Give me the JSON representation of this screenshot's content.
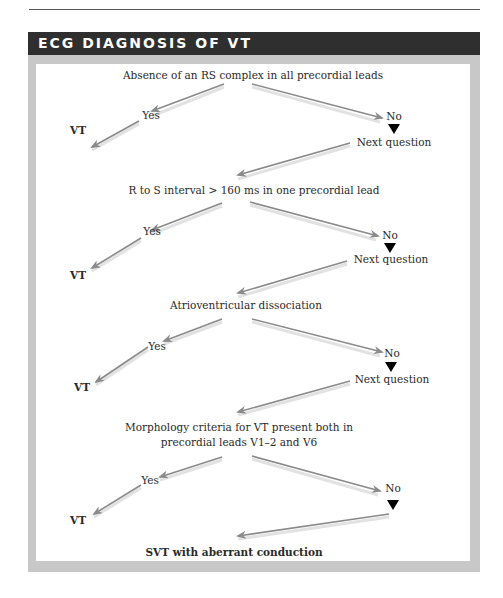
{
  "page": {
    "running_header": "...cardiac diagnosis and physiology"
  },
  "box": {
    "title": "ECG DIAGNOSIS OF VT"
  },
  "flowchart": {
    "questions": [
      {
        "text": "Absence of an RS complex in all precordial leads",
        "yes_label": "Yes",
        "yes_outcome": "VT",
        "no_label": "No",
        "next_label": "Next question"
      },
      {
        "text": "R to S interval > 160 ms in one precordial lead",
        "yes_label": "Yes",
        "yes_outcome": "VT",
        "no_label": "No",
        "next_label": "Next question"
      },
      {
        "text": "Atrioventricular dissociation",
        "yes_label": "Yes",
        "yes_outcome": "VT",
        "no_label": "No",
        "next_label": "Next question"
      },
      {
        "text_line1": "Morphology criteria for VT present both in",
        "text_line2": "precordial leads V1–2 and V6",
        "yes_label": "Yes",
        "yes_outcome": "VT",
        "no_label": "No"
      }
    ],
    "final_outcome": "SVT with aberrant conduction"
  },
  "colors": {
    "header_bar": "#2f2f2f",
    "frame": "#c8c8c8",
    "panel": "#ffffff",
    "arrow": "#8a8a8a",
    "arrow_shadow": "#e2e2e2",
    "no_triangle": "#000000"
  }
}
